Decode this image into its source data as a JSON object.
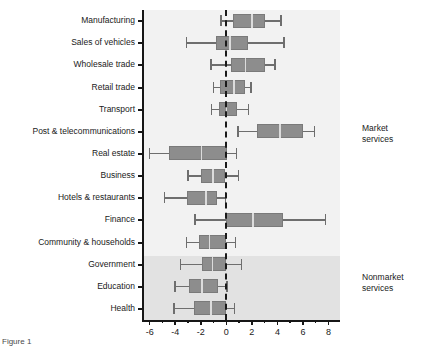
{
  "chart_data": {
    "type": "box",
    "title": "",
    "xlabel": "",
    "ylabel": "",
    "xlim": [
      -6.6,
      8.9
    ],
    "xticks": [
      -6,
      -4,
      -2,
      0,
      2,
      4,
      6,
      8
    ],
    "xtick_labels": [
      "-6",
      "-4",
      "-2",
      "0",
      "2",
      "4",
      "6",
      "8"
    ],
    "minor_ticks": [
      -5,
      -3,
      -1,
      1,
      3,
      5,
      7
    ],
    "zero_reference_line": 0,
    "grid": false,
    "legend": "none",
    "orientation": "horizontal",
    "categories": [
      "Manufacturing",
      "Sales of vehicles",
      "Wholesale trade",
      "Retail trade",
      "Transport",
      "Post & telecommunications",
      "Real estate",
      "Business",
      "Hotels & restaurants",
      "Finance",
      "Community & households",
      "Government",
      "Education",
      "Health"
    ],
    "boxes": [
      {
        "label": "Manufacturing",
        "whisker_low": -0.4,
        "q1": 0.5,
        "median": 2.0,
        "q3": 3.0,
        "whisker_high": 4.3
      },
      {
        "label": "Sales of vehicles",
        "whisker_low": -3.1,
        "q1": -0.8,
        "median": 0.3,
        "q3": 1.7,
        "whisker_high": 4.5
      },
      {
        "label": "Wholesale trade",
        "whisker_low": -1.2,
        "q1": 0.4,
        "median": 1.5,
        "q3": 3.0,
        "whisker_high": 3.8
      },
      {
        "label": "Retail trade",
        "whisker_low": -1.0,
        "q1": -0.5,
        "median": 0.6,
        "q3": 1.45,
        "whisker_high": 1.95
      },
      {
        "label": "Transport",
        "whisker_low": -1.15,
        "q1": -0.6,
        "median": 0.0,
        "q3": 0.8,
        "whisker_high": 1.75
      },
      {
        "label": "Post & telecommunications",
        "whisker_low": 0.9,
        "q1": 2.4,
        "median": 4.2,
        "q3": 6.0,
        "whisker_high": 6.9
      },
      {
        "label": "Real estate",
        "whisker_low": -6.0,
        "q1": -4.5,
        "median": -1.95,
        "q3": 0.05,
        "whisker_high": 0.8
      },
      {
        "label": "Business",
        "whisker_low": -3.0,
        "q1": -1.95,
        "median": -1.05,
        "q3": -0.1,
        "whisker_high": 0.95
      },
      {
        "label": "Hotels & restaurants",
        "whisker_low": -4.85,
        "q1": -3.1,
        "median": -1.6,
        "q3": -0.7,
        "whisker_high": -0.05
      },
      {
        "label": "Finance",
        "whisker_low": -2.45,
        "q1": 0.0,
        "median": 2.1,
        "q3": 4.4,
        "whisker_high": 7.75
      },
      {
        "label": "Community & households",
        "whisker_low": -3.1,
        "q1": -2.1,
        "median": -1.3,
        "q3": -0.05,
        "whisker_high": 0.7
      },
      {
        "label": "Government",
        "whisker_low": -3.6,
        "q1": -1.9,
        "median": -1.1,
        "q3": -0.05,
        "whisker_high": 1.2
      },
      {
        "label": "Education",
        "whisker_low": -4.0,
        "q1": -2.9,
        "median": -1.9,
        "q3": -0.65,
        "whisker_high": 0.05
      },
      {
        "label": "Health",
        "whisker_low": -4.1,
        "q1": -2.5,
        "median": -1.2,
        "q3": 0.0,
        "whisker_high": 0.65
      }
    ],
    "groups": [
      {
        "name": "market",
        "label_line1": "Market",
        "label_line2": "services",
        "categories_from": "Manufacturing",
        "categories_to": "Community & households"
      },
      {
        "name": "nonmarket",
        "label_line1": "Nonmarket",
        "label_line2": "services",
        "categories_from": "Government",
        "categories_to": "Health"
      }
    ]
  },
  "colors": {
    "box_fill": "#8d8d8d",
    "box_edge": "#7a7a7a",
    "whisker": "#6e6e6e",
    "median": "#dcdcdc",
    "axis": "#161616",
    "band_market": "#f2f2f2",
    "band_nonmarket": "#e2e2e2",
    "background": "#ffffff",
    "text": "#1a1a1a"
  },
  "caption": {
    "text": "Figure 1"
  }
}
